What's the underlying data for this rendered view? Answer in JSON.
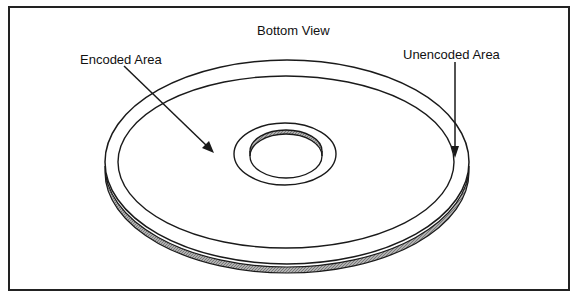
{
  "diagram": {
    "title": "Bottom View",
    "labels": {
      "encoded_area": "Encoded Area",
      "unencoded_area": "Unencoded Area"
    },
    "colors": {
      "line": "#1a1a1a",
      "rim_fill": "#9a9a9a",
      "background": "#ffffff"
    }
  }
}
